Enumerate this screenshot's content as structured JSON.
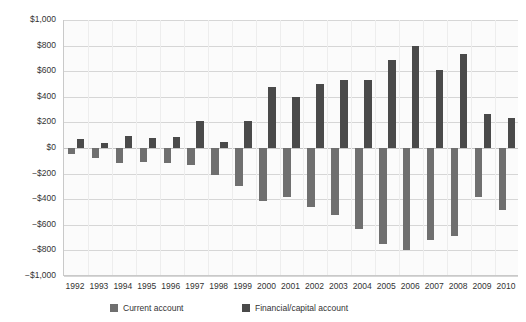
{
  "chart_data": {
    "type": "bar",
    "title": "",
    "xlabel": "",
    "ylabel": "",
    "ylim": [
      -1000,
      1000
    ],
    "grid": true,
    "legend_position": "bottom",
    "categories": [
      "1992",
      "1993",
      "1994",
      "1995",
      "1996",
      "1997",
      "1998",
      "1999",
      "2000",
      "2001",
      "2002",
      "2003",
      "2004",
      "2005",
      "2006",
      "2007",
      "2008",
      "2009",
      "2010"
    ],
    "ytick_labels": [
      "$1,000",
      "$800",
      "$600",
      "$400",
      "$200",
      "$0",
      "−$200",
      "−$400",
      "−$600",
      "−$800",
      "−$1,000"
    ],
    "ytick_values": [
      1000,
      800,
      600,
      400,
      200,
      0,
      -200,
      -400,
      -600,
      -800,
      -1000
    ],
    "series": [
      {
        "name": "Current account",
        "color": "#6f6f6f",
        "values": [
          -50,
          -82,
          -118,
          -110,
          -120,
          -136,
          -210,
          -300,
          -417,
          -385,
          -460,
          -522,
          -631,
          -749,
          -800,
          -719,
          -687,
          -382,
          -487
        ]
      },
      {
        "name": "Financial/capital account",
        "color": "#4a4a4a",
        "values": [
          72,
          42,
          92,
          81,
          84,
          209,
          48,
          211,
          478,
          400,
          500,
          533,
          532,
          687,
          798,
          613,
          731,
          269,
          237
        ]
      }
    ]
  },
  "legend": {
    "items": [
      {
        "label": "Current account",
        "swatch": "current"
      },
      {
        "label": "Financial/capital account",
        "swatch": "financial"
      }
    ]
  }
}
